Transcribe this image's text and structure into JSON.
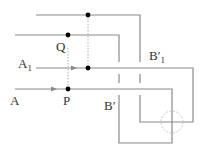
{
  "diagram": {
    "labels": {
      "A": "A",
      "A1": "A",
      "A1_sub": "1",
      "P": "P",
      "Q": "Q",
      "B_prime": "B′",
      "B1_prime": "B′",
      "B1_prime_sub": "1"
    },
    "colors": {
      "line": "#8a8a8a",
      "dot": "#000000",
      "dotted": "#b0b0b0",
      "circle": "#c8c8c8"
    }
  }
}
